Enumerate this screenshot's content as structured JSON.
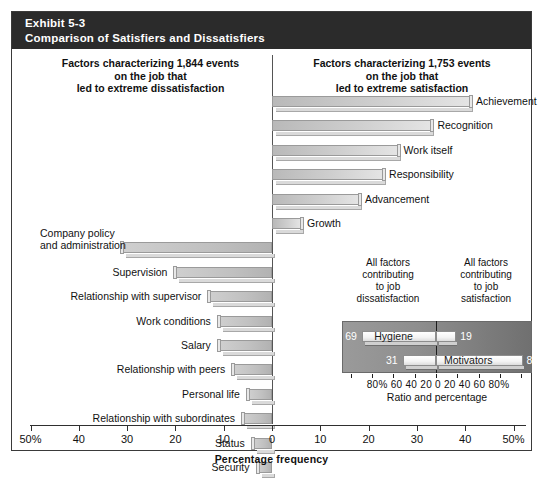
{
  "exhibit": {
    "number": "Exhibit 5-3",
    "title": "Comparison of Satisfiers and Dissatisfiers"
  },
  "headings": {
    "left": "Factors characterizing 1,844 events\non the job that\nled to extreme dissatisfaction",
    "left_line1": "Factors characterizing 1,844 events",
    "left_line2": "on the job that",
    "left_line3": "led to extreme dissatisfaction",
    "right_line1": "Factors characterizing 1,753 events",
    "right_line2": "on the job that",
    "right_line3": "led to extreme satisfaction"
  },
  "axis": {
    "title": "Percentage frequency",
    "ticks": [
      "50%",
      "40",
      "30",
      "20",
      "10",
      "0",
      "10",
      "20",
      "30",
      "40",
      "50%"
    ],
    "tick_values": [
      -50,
      -40,
      -30,
      -20,
      -10,
      0,
      10,
      20,
      30,
      40,
      50
    ],
    "min": -50,
    "max": 50
  },
  "inset": {
    "head_left_line1": "All factors",
    "head_left_line2": "contributing",
    "head_left_line3": "to job",
    "head_left_line4": "dissatisfaction",
    "head_right_line1": "All factors",
    "head_right_line2": "contributing",
    "head_right_line3": "to job",
    "head_right_line4": "satisfaction",
    "axis_labels": "80% 60  40  20   0   20  40  60 80%",
    "axis_title": "Ratio and percentage",
    "rows": [
      {
        "name": "Hygiene",
        "left_value": "69",
        "right_value": "19",
        "left_pct": 69,
        "right_pct": 19
      },
      {
        "name": "Motivators",
        "left_value": "31",
        "right_value": "81",
        "left_pct": 31,
        "right_pct": 81
      }
    ]
  },
  "chart_data": {
    "type": "bar",
    "orientation": "horizontal-diverging",
    "title": "Comparison of Satisfiers and Dissatisfiers",
    "xlabel": "Percentage frequency",
    "ylabel": "",
    "xlim": [
      -50,
      50
    ],
    "xticks": [
      -50,
      -40,
      -30,
      -20,
      -10,
      0,
      10,
      20,
      30,
      40,
      50
    ],
    "xticklabels": [
      "50%",
      "40",
      "30",
      "20",
      "10",
      "0",
      "10",
      "20",
      "30",
      "40",
      "50%"
    ],
    "grid": false,
    "legend": "none",
    "series": [
      {
        "name": "Factors characterizing 1,753 events on the job that led to extreme satisfaction",
        "side": "right",
        "categories": [
          "Achievement",
          "Recognition",
          "Work itself",
          "Responsibility",
          "Advancement",
          "Growth"
        ],
        "values": [
          41,
          33,
          26,
          23,
          18,
          6
        ]
      },
      {
        "name": "Factors characterizing 1,844 events on the job that led to extreme dissatisfaction",
        "side": "left",
        "categories": [
          "Company policy and administration",
          "Supervision",
          "Relationship with supervisor",
          "Work conditions",
          "Salary",
          "Relationship with peers",
          "Personal life",
          "Relationship with subordinates",
          "Status",
          "Security"
        ],
        "values": [
          31,
          20,
          13,
          11,
          11,
          8,
          5,
          6,
          4,
          3
        ]
      }
    ],
    "inset_chart": {
      "type": "bar",
      "orientation": "horizontal-diverging",
      "xlabel": "Ratio and percentage",
      "xlim": [
        -80,
        80
      ],
      "xticks": [
        -80,
        -60,
        -40,
        -20,
        0,
        20,
        40,
        60,
        80
      ],
      "xticklabels": [
        "80%",
        "60",
        "40",
        "20",
        "0",
        "20",
        "40",
        "60",
        "80%"
      ],
      "categories": [
        "Hygiene",
        "Motivators"
      ],
      "left_values": [
        69,
        31
      ],
      "right_values": [
        19,
        81
      ]
    }
  },
  "bars": {
    "right": [
      {
        "label": "Achievement",
        "value": 41
      },
      {
        "label": "Recognition",
        "value": 33
      },
      {
        "label": "Work itself",
        "value": 26
      },
      {
        "label": "Responsibility",
        "value": 23
      },
      {
        "label": "Advancement",
        "value": 18
      },
      {
        "label": "Growth",
        "value": 6
      }
    ],
    "left": [
      {
        "label": "Company policy and administration",
        "value": 31
      },
      {
        "label": "Supervision",
        "value": 20
      },
      {
        "label": "Relationship with supervisor",
        "value": 13
      },
      {
        "label": "Work conditions",
        "value": 11
      },
      {
        "label": "Salary",
        "value": 11
      },
      {
        "label": "Relationship with peers",
        "value": 8
      },
      {
        "label": "Personal life",
        "value": 5
      },
      {
        "label": "Relationship with subordinates",
        "value": 6
      },
      {
        "label": "Status",
        "value": 4
      },
      {
        "label": "Security",
        "value": 3
      }
    ]
  },
  "colors": {
    "title_band": "#2b2b2b",
    "frame": "#3a3a3a",
    "bar_fill": "#c6c6c6",
    "inset_panel": "#8e8e8e",
    "text": "#111111"
  }
}
